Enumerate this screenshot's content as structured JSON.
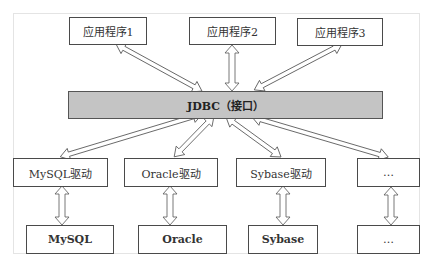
{
  "diagram": {
    "applications": [
      {
        "label": "应用程序1"
      },
      {
        "label": "应用程序2"
      },
      {
        "label": "应用程序3"
      }
    ],
    "interface": {
      "label": "JDBC（接口）"
    },
    "drivers": [
      {
        "label": "MySQL驱动"
      },
      {
        "label": "Oracle驱动"
      },
      {
        "label": "Sybase驱动"
      },
      {
        "label": "…"
      }
    ],
    "databases": [
      {
        "label": "MySQL"
      },
      {
        "label": "Oracle"
      },
      {
        "label": "Sybase"
      },
      {
        "label": "…"
      }
    ],
    "colors": {
      "interface_fill": "#c4c4c4",
      "box_border": "#4a4a4a",
      "arrow_stroke": "#555555"
    },
    "connections": [
      {
        "from": "应用程序1",
        "to": "JDBC（接口）",
        "type": "bidirectional"
      },
      {
        "from": "应用程序2",
        "to": "JDBC（接口）",
        "type": "bidirectional"
      },
      {
        "from": "应用程序3",
        "to": "JDBC（接口）",
        "type": "bidirectional"
      },
      {
        "from": "JDBC（接口）",
        "to": "MySQL驱动",
        "type": "bidirectional"
      },
      {
        "from": "JDBC（接口）",
        "to": "Oracle驱动",
        "type": "bidirectional"
      },
      {
        "from": "JDBC（接口）",
        "to": "Sybase驱动",
        "type": "bidirectional"
      },
      {
        "from": "JDBC（接口）",
        "to": "…",
        "type": "bidirectional"
      },
      {
        "from": "MySQL驱动",
        "to": "MySQL",
        "type": "bidirectional"
      },
      {
        "from": "Oracle驱动",
        "to": "Oracle",
        "type": "bidirectional"
      },
      {
        "from": "Sybase驱动",
        "to": "Sybase",
        "type": "bidirectional"
      },
      {
        "from": "…",
        "to": "…",
        "type": "bidirectional"
      }
    ]
  }
}
